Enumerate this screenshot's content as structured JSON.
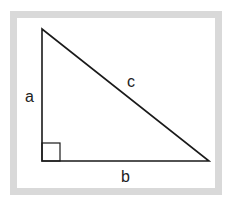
{
  "diagram": {
    "type": "right-triangle",
    "labels": {
      "a": "a",
      "b": "b",
      "c": "c"
    },
    "colors": {
      "frame": "#d9d9d9",
      "stroke": "#1a1a1a",
      "background": "#ffffff"
    }
  }
}
